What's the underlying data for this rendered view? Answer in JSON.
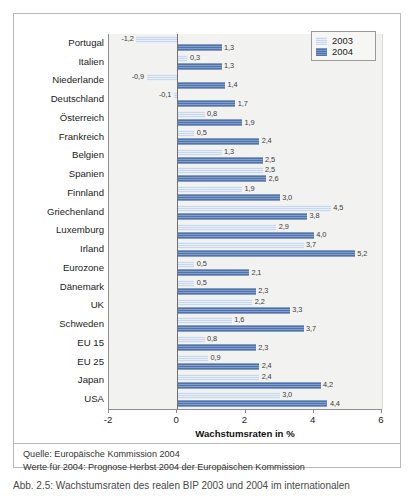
{
  "chart_data": {
    "type": "bar",
    "orientation": "horizontal",
    "title": "",
    "xlabel": "Wachstumsraten in %",
    "ylabel": "",
    "xlim": [
      -2,
      6
    ],
    "xticks": [
      -2,
      0,
      2,
      4,
      6
    ],
    "xticklabels": [
      "-2",
      "0",
      "2",
      "4",
      "6"
    ],
    "grid": false,
    "legend_position": "top-right",
    "categories": [
      "Portugal",
      "Italien",
      "Niederlande",
      "Deutschland",
      "Österreich",
      "Frankreich",
      "Belgien",
      "Spanien",
      "Finnland",
      "Griechenland",
      "Luxemburg",
      "Irland",
      "Eurozone",
      "Dänemark",
      "UK",
      "Schweden",
      "EU 15",
      "EU 25",
      "Japan",
      "USA"
    ],
    "series": [
      {
        "name": "2003",
        "color": "#c9d7ea",
        "values": [
          -1.2,
          0.3,
          -0.9,
          -0.1,
          0.8,
          0.5,
          1.3,
          2.5,
          1.9,
          4.5,
          2.9,
          3.7,
          0.5,
          0.5,
          2.2,
          1.6,
          0.8,
          0.9,
          2.4,
          3.0
        ],
        "labels": [
          "-1,2",
          "0,3",
          "-0,9",
          "-0,1",
          "0,8",
          "0,5",
          "1,3",
          "2,5",
          "1,9",
          "4,5",
          "2,9",
          "3,7",
          "0,5",
          "0,5",
          "2,2",
          "1,6",
          "0,8",
          "0,9",
          "2,4",
          "3,0"
        ]
      },
      {
        "name": "2004",
        "color": "#4f74ad",
        "values": [
          1.3,
          1.3,
          1.4,
          1.7,
          1.9,
          2.4,
          2.5,
          2.6,
          3.0,
          3.8,
          4.0,
          5.2,
          2.1,
          2.3,
          3.3,
          3.7,
          2.3,
          2.4,
          4.2,
          4.4
        ],
        "labels": [
          "1,3",
          "1,3",
          "1,4",
          "1,7",
          "1,9",
          "2,4",
          "2,5",
          "2,6",
          "3,0",
          "3,8",
          "4,0",
          "5,2",
          "2,1",
          "2,3",
          "3,3",
          "3,7",
          "2,3",
          "2,4",
          "4,2",
          "4,4"
        ]
      }
    ]
  },
  "legend": {
    "entries": [
      {
        "label": "2003",
        "color": "#c9d7ea"
      },
      {
        "label": "2004",
        "color": "#4f74ad"
      }
    ]
  },
  "footer": {
    "line1": "Quelle: Europäische Kommission 2004",
    "line2": "Werte für 2004: Prognose Herbst 2004 der Europäischen Kommission"
  },
  "caption": {
    "text": "Abb. 2.5: Wachstumsraten des realen BIP 2003 und 2004 im internationalen"
  },
  "colors": {
    "series_2003": "#c9d7ea",
    "series_2004": "#4f74ad",
    "plot_background": "#f2f2f0",
    "axis": "#8d8d8d",
    "frame": "#b9b9b9"
  }
}
